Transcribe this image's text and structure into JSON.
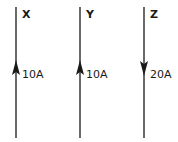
{
  "diagram": {
    "wires": [
      {
        "name": "X",
        "current": "10A",
        "direction": "up"
      },
      {
        "name": "Y",
        "current": "10A",
        "direction": "up"
      },
      {
        "name": "Z",
        "current": "20A",
        "direction": "down"
      }
    ],
    "colors": {
      "wire": "#1a1a1a",
      "background": "#ffffff"
    }
  }
}
